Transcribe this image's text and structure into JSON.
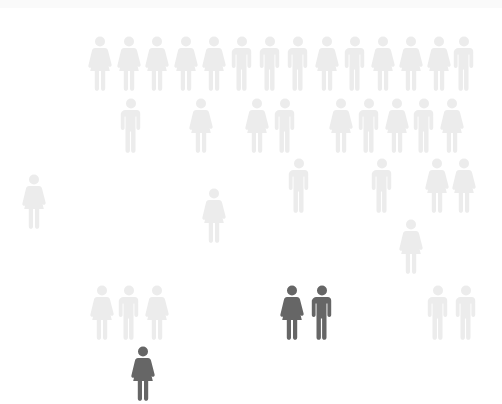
{
  "colors": {
    "background": "#ffffff",
    "faded": "#ececec",
    "highlight": "#666666"
  },
  "figures": [
    {
      "x": 100,
      "y": 35,
      "gender": "female",
      "highlighted": false
    },
    {
      "x": 129,
      "y": 35,
      "gender": "female",
      "highlighted": false
    },
    {
      "x": 157,
      "y": 35,
      "gender": "female",
      "highlighted": false
    },
    {
      "x": 186,
      "y": 35,
      "gender": "female",
      "highlighted": false
    },
    {
      "x": 214,
      "y": 35,
      "gender": "female",
      "highlighted": false
    },
    {
      "x": 242,
      "y": 35,
      "gender": "male",
      "highlighted": false
    },
    {
      "x": 270,
      "y": 35,
      "gender": "male",
      "highlighted": false
    },
    {
      "x": 298,
      "y": 35,
      "gender": "male",
      "highlighted": false
    },
    {
      "x": 327,
      "y": 35,
      "gender": "female",
      "highlighted": false
    },
    {
      "x": 355,
      "y": 35,
      "gender": "male",
      "highlighted": false
    },
    {
      "x": 383,
      "y": 35,
      "gender": "female",
      "highlighted": false
    },
    {
      "x": 411,
      "y": 35,
      "gender": "female",
      "highlighted": false
    },
    {
      "x": 439,
      "y": 35,
      "gender": "female",
      "highlighted": false
    },
    {
      "x": 464,
      "y": 35,
      "gender": "male",
      "highlighted": false
    },
    {
      "x": 131,
      "y": 97,
      "gender": "male",
      "highlighted": false
    },
    {
      "x": 201,
      "y": 97,
      "gender": "female",
      "highlighted": false
    },
    {
      "x": 257,
      "y": 97,
      "gender": "female",
      "highlighted": false
    },
    {
      "x": 285,
      "y": 97,
      "gender": "male",
      "highlighted": false
    },
    {
      "x": 341,
      "y": 97,
      "gender": "female",
      "highlighted": false
    },
    {
      "x": 369,
      "y": 97,
      "gender": "male",
      "highlighted": false
    },
    {
      "x": 397,
      "y": 97,
      "gender": "female",
      "highlighted": false
    },
    {
      "x": 424,
      "y": 97,
      "gender": "male",
      "highlighted": false
    },
    {
      "x": 452,
      "y": 97,
      "gender": "female",
      "highlighted": false
    },
    {
      "x": 299,
      "y": 157,
      "gender": "male",
      "highlighted": false
    },
    {
      "x": 382,
      "y": 157,
      "gender": "male",
      "highlighted": false
    },
    {
      "x": 437,
      "y": 157,
      "gender": "female",
      "highlighted": false
    },
    {
      "x": 464,
      "y": 157,
      "gender": "female",
      "highlighted": false
    },
    {
      "x": 34,
      "y": 173,
      "gender": "female",
      "highlighted": false
    },
    {
      "x": 214,
      "y": 187,
      "gender": "female",
      "highlighted": false
    },
    {
      "x": 411,
      "y": 218,
      "gender": "female",
      "highlighted": false
    },
    {
      "x": 102,
      "y": 284,
      "gender": "female",
      "highlighted": false
    },
    {
      "x": 129,
      "y": 284,
      "gender": "male",
      "highlighted": false
    },
    {
      "x": 157,
      "y": 284,
      "gender": "female",
      "highlighted": false
    },
    {
      "x": 292,
      "y": 284,
      "gender": "female",
      "highlighted": true
    },
    {
      "x": 322,
      "y": 284,
      "gender": "male",
      "highlighted": true
    },
    {
      "x": 438,
      "y": 284,
      "gender": "male",
      "highlighted": false
    },
    {
      "x": 466,
      "y": 284,
      "gender": "male",
      "highlighted": false
    },
    {
      "x": 143,
      "y": 345,
      "gender": "female",
      "highlighted": true
    }
  ]
}
